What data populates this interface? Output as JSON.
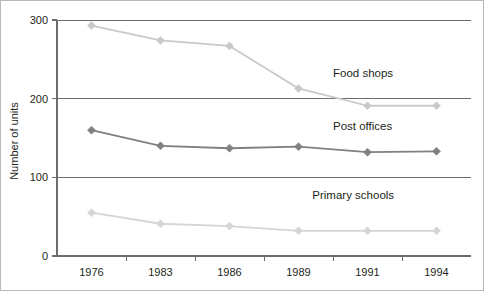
{
  "chart_data": {
    "type": "line",
    "title": "",
    "xlabel": "",
    "ylabel": "Number of units",
    "categories": [
      "1976",
      "1983",
      "1986",
      "1989",
      "1991",
      "1994"
    ],
    "x": [
      1976,
      1983,
      1986,
      1989,
      1991,
      1994
    ],
    "ylim": [
      0,
      300
    ],
    "yticks": [
      0,
      100,
      200,
      300
    ],
    "ytick_labels": [
      "0",
      "100",
      "200",
      "300"
    ],
    "grid": "horizontal",
    "legend_position": "inline-right",
    "series": [
      {
        "name": "Food shops",
        "values": [
          293,
          274,
          267,
          213,
          191,
          191
        ],
        "color": "#c9c9c9",
        "marker": "diamond",
        "label_x": 1990.0,
        "label_y": 228
      },
      {
        "name": "Post offices",
        "values": [
          160,
          140,
          137,
          139,
          132,
          133
        ],
        "color": "#808080",
        "marker": "diamond",
        "label_x": 1990.0,
        "label_y": 160
      },
      {
        "name": "Primary schools",
        "values": [
          55,
          41,
          38,
          32,
          32,
          32
        ],
        "color": "#d5d5d5",
        "marker": "diamond",
        "label_x": 1989.4,
        "label_y": 72
      }
    ]
  },
  "axis": {
    "line_color": "#6d6d6d",
    "grid_color": "#6d6d6d",
    "tick_color": "#6d6d6d"
  },
  "frame": {
    "border_color": "#b9b9b9",
    "background": "#ffffff"
  }
}
